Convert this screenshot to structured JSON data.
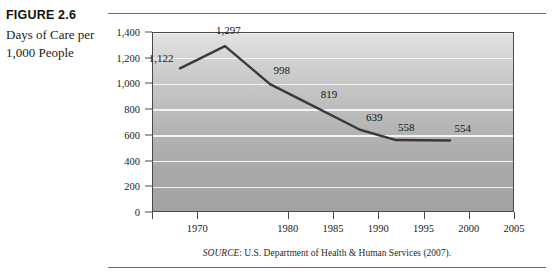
{
  "figure": {
    "number": "FIGURE 2.6",
    "title": "Days of Care per 1,000 People",
    "source_prefix": "SOURCE",
    "source_text": ": U.S. Department of Health & Human Services (2007)."
  },
  "chart_data": {
    "type": "line",
    "title": "Days of Care per 1,000 People",
    "xlabel": "",
    "ylabel": "",
    "ylim": [
      0,
      1400
    ],
    "xlim": [
      1965,
      2005
    ],
    "grid": true,
    "legend": "none",
    "ytick_labels": [
      "0",
      "200",
      "400",
      "600",
      "800",
      "1,000",
      "1,200",
      "1,400"
    ],
    "ytick_values": [
      0,
      200,
      400,
      600,
      800,
      1000,
      1200,
      1400
    ],
    "xtick_labels": [
      "",
      "1970",
      "1980",
      "1985",
      "1990",
      "1995",
      "2000",
      "2005"
    ],
    "xtick_values": [
      1965,
      1970,
      1980,
      1985,
      1990,
      1995,
      2000,
      2005
    ],
    "x": [
      1968,
      1973,
      1978,
      1983,
      1988,
      1992,
      1998
    ],
    "values": [
      1122,
      1297,
      998,
      819,
      639,
      558,
      554
    ],
    "point_labels": [
      "1,122",
      "1,297",
      "998",
      "819",
      "639",
      "558",
      "554"
    ],
    "series": [
      {
        "name": "Days of Care per 1,000 People",
        "values": [
          1122,
          1297,
          998,
          819,
          639,
          558,
          554
        ]
      }
    ]
  },
  "colors": {
    "line": "#3a3a3a",
    "grid": "#f4f4f4",
    "plot_bg_top": "#e3e3e3",
    "plot_bg_bottom": "#a2a2a2",
    "axis": "#4a4a4a",
    "text": "#1b1b1b"
  }
}
